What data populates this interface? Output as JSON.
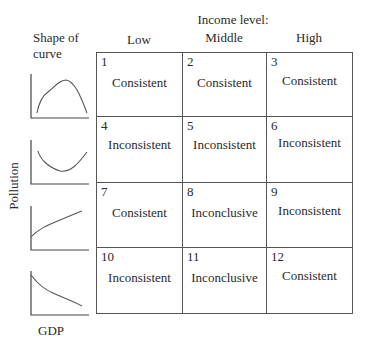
{
  "header": {
    "shape_label_line1": "Shape of",
    "shape_label_line2": "curve",
    "income_label": "Income level:",
    "columns": [
      "Low",
      "Middle",
      "High"
    ]
  },
  "axes": {
    "y_label": "Pollution",
    "x_label": "GDP"
  },
  "curve_shapes": [
    {
      "name": "inverted-u",
      "description": "Inverted U"
    },
    {
      "name": "u-shape",
      "description": "U-shaped"
    },
    {
      "name": "increasing",
      "description": "Monotonically increasing"
    },
    {
      "name": "decreasing",
      "description": "Monotonically decreasing"
    }
  ],
  "rows": [
    {
      "shape": "inverted-u",
      "cells": [
        {
          "num": "1",
          "verdict": "Consistent"
        },
        {
          "num": "2",
          "verdict": "Consistent"
        },
        {
          "num": "3",
          "verdict": "Consistent"
        }
      ]
    },
    {
      "shape": "u-shape",
      "cells": [
        {
          "num": "4",
          "verdict": "Inconsistent"
        },
        {
          "num": "5",
          "verdict": "Inconsistent"
        },
        {
          "num": "6",
          "verdict": "Inconsistent"
        }
      ]
    },
    {
      "shape": "increasing",
      "cells": [
        {
          "num": "7",
          "verdict": "Consistent"
        },
        {
          "num": "8",
          "verdict": "Inconclusive"
        },
        {
          "num": "9",
          "verdict": "Inconsistent"
        }
      ]
    },
    {
      "shape": "decreasing",
      "cells": [
        {
          "num": "10",
          "verdict": "Inconsistent"
        },
        {
          "num": "11",
          "verdict": "Inconclusive"
        },
        {
          "num": "12",
          "verdict": "Consistent"
        }
      ]
    }
  ]
}
